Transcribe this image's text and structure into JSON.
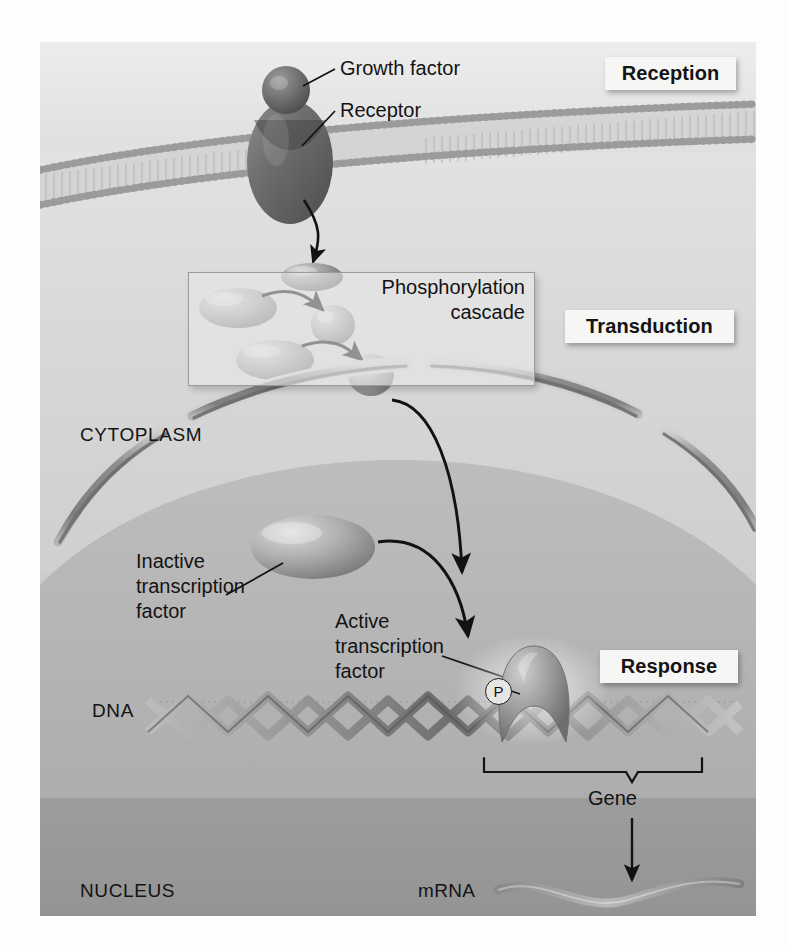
{
  "figure": {
    "stages": [
      {
        "id": "reception",
        "label": "Reception"
      },
      {
        "id": "transduction",
        "label": "Transduction"
      },
      {
        "id": "response",
        "label": "Response"
      }
    ],
    "compartments": [
      {
        "id": "cytoplasm",
        "label": "CYTOPLASM"
      },
      {
        "id": "nucleus",
        "label": "NUCLEUS"
      }
    ],
    "labels": {
      "growth_factor": "Growth factor",
      "receptor": "Receptor",
      "phosphorylation_cascade": "Phosphorylation cascade",
      "inactive_transcription_factor": "Inactive\ntranscription\nfactor",
      "active_transcription_factor": "Active\ntranscription\nfactor",
      "dna": "DNA",
      "gene": "Gene",
      "mrna": "mRNA",
      "phosphate_badge": "P"
    },
    "colors": {
      "background": "#fdfdfd",
      "extracellular": "#ededed",
      "cytoplasm": "#d8d8d8",
      "nucleoplasm": "#b2b2b2",
      "membrane_head": "#9a9a9a",
      "protein_fill": "#8f8f8f",
      "receptor_fill": "#6f6f6f",
      "chip_background": "#f6f6f4",
      "ink": "#131313"
    }
  }
}
